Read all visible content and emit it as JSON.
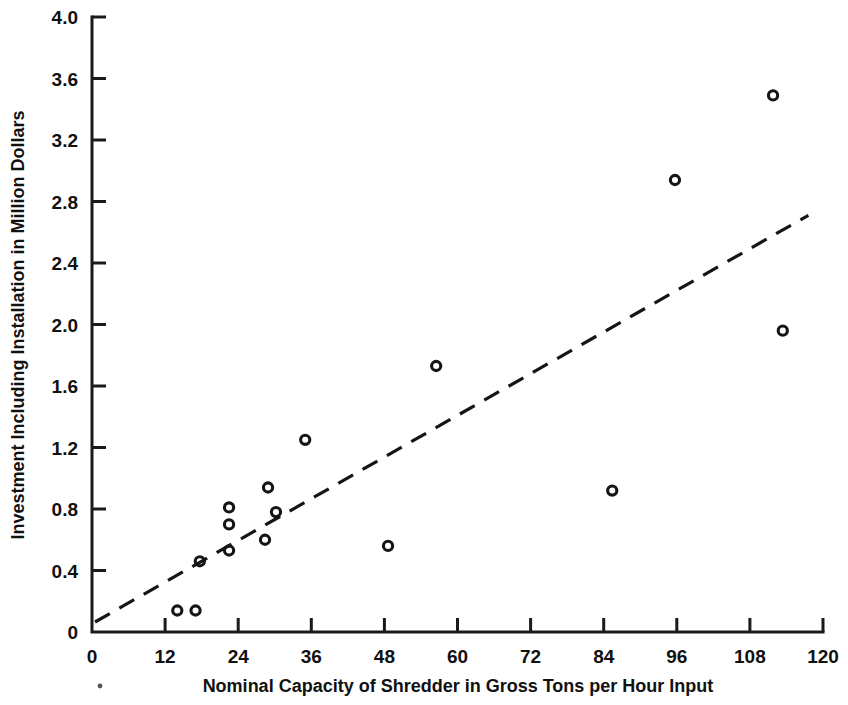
{
  "chart_data": {
    "type": "scatter",
    "title": "",
    "xlabel": "Nominal Capacity of Shredder in Gross Tons per Hour Input",
    "ylabel": "Investment Including Installation in Million Dollars",
    "xlim": [
      0,
      120
    ],
    "ylim": [
      0,
      4.0
    ],
    "xticks": [
      0,
      12,
      24,
      36,
      48,
      60,
      72,
      84,
      96,
      108,
      120
    ],
    "xtick_labels": [
      "0",
      "12",
      "24",
      "36",
      "48",
      "60",
      "72",
      "84",
      "96",
      "108",
      "120"
    ],
    "yticks": [
      0,
      0.4,
      0.8,
      1.2,
      1.6,
      2.0,
      2.4,
      2.8,
      3.2,
      3.6,
      4.0
    ],
    "ytick_labels": [
      "0",
      "0.4",
      "0.8",
      "1.2",
      "1.6",
      "2.0",
      "2.4",
      "2.8",
      "3.2",
      "3.6",
      "4.0"
    ],
    "grid": false,
    "legend": false,
    "marker_style": "open-circle",
    "points": [
      {
        "x": 14.0,
        "y": 0.14
      },
      {
        "x": 17.0,
        "y": 0.14
      },
      {
        "x": 17.7,
        "y": 0.46
      },
      {
        "x": 22.5,
        "y": 0.81
      },
      {
        "x": 22.5,
        "y": 0.7
      },
      {
        "x": 22.5,
        "y": 0.53
      },
      {
        "x": 28.4,
        "y": 0.6
      },
      {
        "x": 28.9,
        "y": 0.94
      },
      {
        "x": 30.2,
        "y": 0.78
      },
      {
        "x": 35.0,
        "y": 1.25
      },
      {
        "x": 48.6,
        "y": 0.56
      },
      {
        "x": 56.5,
        "y": 1.73
      },
      {
        "x": 85.4,
        "y": 0.92
      },
      {
        "x": 95.7,
        "y": 2.94
      },
      {
        "x": 111.8,
        "y": 3.49
      },
      {
        "x": 113.4,
        "y": 1.96
      }
    ],
    "trendline": {
      "style": "dashed",
      "x_start": 0.5,
      "y_start": 0.065,
      "x_end": 117.6,
      "y_end": 2.71
    }
  },
  "axes": {
    "y_axis_name": "y-axis",
    "x_axis_name": "x-axis"
  }
}
